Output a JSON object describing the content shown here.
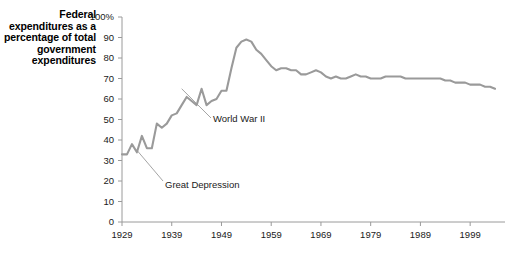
{
  "chart_data": {
    "type": "line",
    "title": "",
    "ylabel": "Federal expenditures as a percentage of total government expenditures",
    "xlabel": "",
    "ylim": [
      0,
      100
    ],
    "xlim": [
      1929,
      2005
    ],
    "grid": false,
    "legend": "none",
    "y_tick_labels": [
      "100%",
      "90",
      "80",
      "70",
      "60",
      "50",
      "40",
      "30",
      "20",
      "10",
      "0"
    ],
    "y_ticks": [
      100,
      90,
      80,
      70,
      60,
      50,
      40,
      30,
      20,
      10,
      0
    ],
    "x_tick_labels": [
      "1929",
      "1939",
      "1949",
      "1959",
      "1969",
      "1979",
      "1989",
      "1999"
    ],
    "x_ticks": [
      1929,
      1939,
      1949,
      1959,
      1969,
      1979,
      1989,
      1999
    ],
    "line_color": "#9a9a9a",
    "annotations": [
      {
        "text": "World War II",
        "x": 1941,
        "y": 65
      },
      {
        "text": "Great Depression",
        "x": 1932,
        "y": 35
      }
    ],
    "series": [
      {
        "name": "Federal share of total government expenditures",
        "x": [
          1929,
          1930,
          1931,
          1932,
          1933,
          1934,
          1935,
          1936,
          1937,
          1938,
          1939,
          1940,
          1941,
          1942,
          1943,
          1944,
          1945,
          1946,
          1947,
          1948,
          1949,
          1950,
          1951,
          1952,
          1953,
          1954,
          1955,
          1956,
          1957,
          1958,
          1959,
          1960,
          1961,
          1962,
          1963,
          1964,
          1965,
          1966,
          1967,
          1968,
          1969,
          1970,
          1971,
          1972,
          1973,
          1974,
          1975,
          1976,
          1977,
          1978,
          1979,
          1980,
          1981,
          1982,
          1983,
          1984,
          1985,
          1986,
          1987,
          1988,
          1989,
          1990,
          1991,
          1992,
          1993,
          1994,
          1995,
          1996,
          1997,
          1998,
          1999,
          2000,
          2001,
          2002,
          2003,
          2004
        ],
        "y": [
          33,
          33,
          38,
          34,
          42,
          36,
          36,
          48,
          46,
          48,
          52,
          53,
          57,
          61,
          59,
          57,
          65,
          57,
          59,
          60,
          64,
          64,
          75,
          85,
          88,
          89,
          88,
          84,
          82,
          79,
          76,
          74,
          75,
          75,
          74,
          74,
          72,
          72,
          73,
          74,
          73,
          71,
          70,
          71,
          70,
          70,
          71,
          72,
          71,
          71,
          70,
          70,
          70,
          71,
          71,
          71,
          71,
          70,
          70,
          70,
          70,
          70,
          70,
          70,
          70,
          69,
          69,
          68,
          68,
          68,
          67,
          67,
          67,
          66,
          66,
          65
        ],
        "description": "Sharp rise during the 1930s, peak near 89% during World War II, gradual decline to about 65% by the 2000s"
      }
    ]
  },
  "geometry": {
    "plot_left": 122,
    "plot_right": 500,
    "plot_top": 17,
    "plot_bottom": 222,
    "x_start_year": 1929,
    "x_end_year": 2005,
    "year_pixel_step": 4.88
  }
}
